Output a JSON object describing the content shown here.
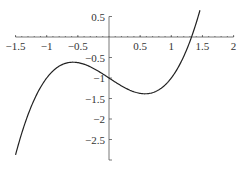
{
  "chart_data": {
    "type": "line",
    "title": "",
    "xlabel": "",
    "ylabel": "",
    "function": "y = x^3 - x - 1",
    "xlim": [
      -1.5,
      2
    ],
    "ylim": [
      -3,
      0.5
    ],
    "grid": false,
    "legend": null,
    "x_ticks": [
      "-1.5",
      "-1",
      "-0.5",
      "0.5",
      "1",
      "1.5",
      "2"
    ],
    "y_ticks": [
      "0.5",
      "-0.5",
      "-1",
      "-1.5",
      "-2",
      "-2.5"
    ],
    "series": [
      {
        "name": "curve",
        "x": [
          -1.5,
          -1.25,
          -1.0,
          -0.75,
          -0.577,
          -0.5,
          -0.25,
          0.0,
          0.25,
          0.5,
          0.577,
          0.75,
          1.0,
          1.25,
          1.3247,
          1.4,
          1.46
        ],
        "y": [
          -2.875,
          -1.703,
          -1.0,
          -0.672,
          -0.615,
          -0.625,
          -0.766,
          -1.0,
          -1.234,
          -1.375,
          -1.385,
          -1.328,
          -1.0,
          -0.297,
          0.0,
          0.344,
          0.652
        ]
      }
    ]
  }
}
